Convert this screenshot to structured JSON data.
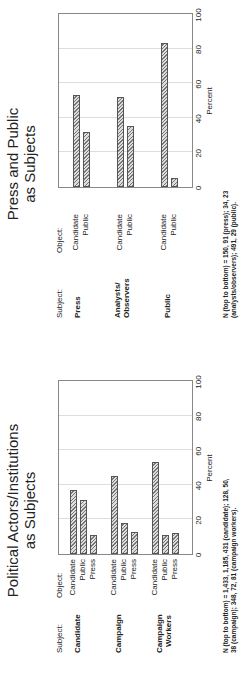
{
  "chart_data": [
    {
      "type": "bar",
      "orientation": "horizontal",
      "title": "Political Actors/Institutions as Subjects",
      "subject_header": "Subject:",
      "object_header": "Object:",
      "xlabel": "Percent",
      "xlim": [
        0,
        100
      ],
      "xticks": [
        0,
        20,
        40,
        60,
        80,
        100
      ],
      "groups": [
        {
          "subject": "Candidate",
          "objects": [
            "Candidate",
            "Public",
            "Press"
          ],
          "values": [
            37,
            31,
            11
          ]
        },
        {
          "subject": "Campaign",
          "objects": [
            "Candidate",
            "Public",
            "Press"
          ],
          "values": [
            45,
            18,
            13
          ]
        },
        {
          "subject": "Campaign Workers",
          "objects": [
            "Candidate",
            "Public",
            "Press"
          ],
          "values": [
            53,
            11,
            12
          ]
        }
      ],
      "note": "N (top to bottom) = 1,433, 1,185, 431 (candidate); 128, 50, 38 (campaign); 348, 72, 81 (campaign workers)."
    },
    {
      "type": "bar",
      "orientation": "horizontal",
      "title": "Press and Public as Subjects",
      "subject_header": "Subject:",
      "object_header": "Object:",
      "xlabel": "Percent",
      "xlim": [
        0,
        100
      ],
      "xticks": [
        0,
        20,
        40,
        60,
        80,
        100
      ],
      "groups": [
        {
          "subject": "Press",
          "objects": [
            "Candidate",
            "Public"
          ],
          "values": [
            53,
            32
          ]
        },
        {
          "subject": "Analysts/ Observers",
          "objects": [
            "Candidate",
            "Public"
          ],
          "values": [
            52,
            35
          ]
        },
        {
          "subject": "Public",
          "objects": [
            "Candidate",
            "Public"
          ],
          "values": [
            83,
            5
          ]
        }
      ],
      "note": "N (top to bottom) = 150, 91 (press); 34, 23 (analysts/observers); 491, 29 (public)."
    }
  ],
  "left": {
    "title_line1": "Political Actors/Institutions",
    "title_line2": "as Subjects",
    "subject_header": "Subject:",
    "object_header": "Object:",
    "subjects": [
      "Candidate",
      "Campaign",
      "Campaign",
      "Workers"
    ],
    "xlabel": "Percent",
    "note": "N (top to bottom) = 1,433, 1,185, 431 (candidate); 128, 50, 38 (campaign); 348, 72, 81 (campaign workers)."
  },
  "right": {
    "title_line1": "Press and Public",
    "title_line2": "as Subjects",
    "subject_header": "Subject:",
    "object_header": "Object:",
    "subjects": [
      "Press",
      "Analysts/",
      "Observers",
      "Public"
    ],
    "xlabel": "Percent",
    "note": "N (top to bottom) = 150, 91 (press); 34, 23 (analysts/observers); 491, 29 (public)."
  },
  "ticks": [
    "0",
    "20",
    "40",
    "60",
    "80",
    "100"
  ],
  "labels": {
    "candidate": "Candidate",
    "public": "Public",
    "press": "Press"
  }
}
